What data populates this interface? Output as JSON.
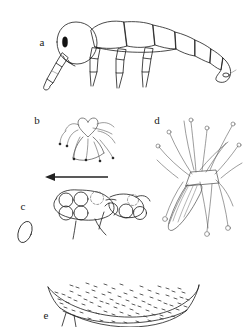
{
  "figure": {
    "kind": "scientific-line-illustration",
    "background_color": "#ffffff",
    "ink_color": "#1c1c1c",
    "width": 248,
    "height": 327,
    "panels": [
      {
        "id": "a",
        "label": "a",
        "label_x": 42,
        "label_y": 46,
        "caption": "whole larva, lateral view",
        "description": "elongate segmented larva with rounded head bearing a dark eye spot, downward antenna, three pairs of legs and a tapering abdomen of seven rings"
      },
      {
        "id": "b",
        "label": "b",
        "label_x": 37,
        "label_y": 124,
        "caption": "cordate structure with setae",
        "description": "heart shaped sclerite surrounded by radiating curved bristles"
      },
      {
        "id": "c",
        "label": "c",
        "label_x": 23,
        "label_y": 210,
        "caption": "egg cluster with directional arrow",
        "description": "group of circular eggs on a lobed substrate, with a leftward arrow above and an isolated oval at left"
      },
      {
        "id": "d",
        "label": "d",
        "label_x": 157,
        "label_y": 124,
        "caption": "lanceolate scale with knobbed setae",
        "description": "leaf shaped scale flanked by long curving setae that terminate in small loops"
      },
      {
        "id": "e",
        "label": "e",
        "label_x": 46,
        "label_y": 319,
        "caption": "stippled dome, ventral surface",
        "description": "broad crescentic dome densely covered with short dash stippling"
      }
    ],
    "annotations": {
      "arrow": {
        "name": "direction-arrow",
        "direction": "left",
        "x_start": 108,
        "x_end": 46,
        "y": 177
      }
    }
  }
}
